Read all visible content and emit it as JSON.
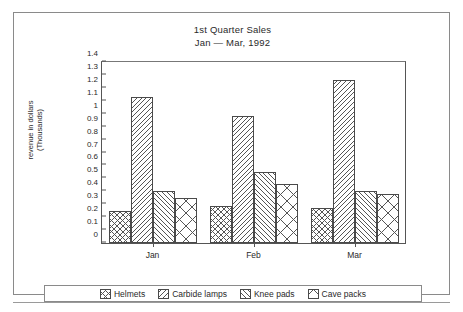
{
  "chart_data": {
    "type": "bar",
    "title": "1st Quarter Sales",
    "subtitle": "Jan — Mar, 1992",
    "xlabel": "",
    "ylabel": "revenue in dollars",
    "ylabel_line2": "(Thousands)",
    "categories": [
      "Jan",
      "Feb",
      "Mar"
    ],
    "series": [
      {
        "name": "Helmets",
        "values": [
          0.25,
          0.29,
          0.27
        ],
        "pattern": "grid"
      },
      {
        "name": "Carbide lamps",
        "values": [
          1.13,
          0.98,
          1.26
        ],
        "pattern": "back-diagonal"
      },
      {
        "name": "Knee pads",
        "values": [
          0.4,
          0.55,
          0.4
        ],
        "pattern": "forward-diagonal"
      },
      {
        "name": "Cave packs",
        "values": [
          0.35,
          0.46,
          0.38
        ],
        "pattern": "cross-diamond"
      }
    ],
    "ylim": [
      0,
      1.4
    ],
    "ytick_step": 0.1,
    "yticks": [
      "0",
      "0.1",
      "0.2",
      "0.3",
      "0.4",
      "0.5",
      "0.6",
      "0.7",
      "0.8",
      "0.9",
      "1",
      "1.1",
      "1.2",
      "1.3",
      "1.4"
    ],
    "grid": false,
    "legend_position": "bottom"
  }
}
